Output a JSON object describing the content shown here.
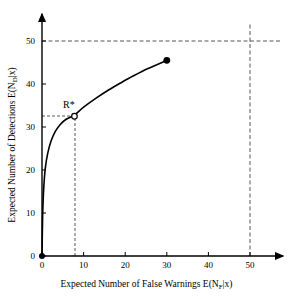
{
  "chart_data": {
    "type": "line",
    "title": "",
    "xlabel_prefix": "Expected Number of False Warnings E(N",
    "xlabel_sub": "F",
    "xlabel_suffix": "|x)",
    "ylabel_prefix": "Expected Number of Detections E(N",
    "ylabel_sub": "D",
    "ylabel_suffix": "|x)",
    "xlabel_full": "Expected Number of False Warnings E(N_F|x)",
    "ylabel_full": "Expected Number of Detections E(N_D|x)",
    "xlim": [
      0,
      58
    ],
    "ylim": [
      0,
      55
    ],
    "xticks": [
      0,
      10,
      20,
      30,
      40,
      50
    ],
    "yticks": [
      0,
      10,
      20,
      30,
      40,
      50
    ],
    "xtick_labels": [
      "0",
      "10",
      "20",
      "30",
      "40",
      "50"
    ],
    "ytick_labels": [
      "0",
      "10",
      "20",
      "30",
      "40",
      "50"
    ],
    "grid": false,
    "legend": "none",
    "axis_arrows": true,
    "series": [
      {
        "name": "Expected detections vs false warnings",
        "x": [
          0,
          0.15,
          0.4,
          0.8,
          1.4,
          2.2,
          3.2,
          4.4,
          5.8,
          7.8,
          10,
          13,
          16,
          19,
          22,
          25.5,
          30
        ],
        "values": [
          0,
          9,
          15.5,
          20.5,
          24,
          26.8,
          29,
          30.6,
          31.8,
          32.8,
          34.6,
          36.7,
          38.6,
          40.3,
          41.9,
          43.6,
          45.5
        ]
      }
    ],
    "markers": [
      {
        "name": "origin-point",
        "x": 0,
        "y": 0,
        "style": "filled-circle",
        "label": ""
      },
      {
        "name": "operating-point-R-star",
        "x": 7.8,
        "y": 32.5,
        "style": "open-circle",
        "label": "R*"
      },
      {
        "name": "curve-endpoint",
        "x": 30,
        "y": 45.5,
        "style": "filled-circle",
        "label": ""
      }
    ],
    "reference_lines": [
      {
        "name": "rstar-horizontal-dashed",
        "orientation": "horizontal",
        "value": 32.5,
        "from": 0,
        "to": 7.8
      },
      {
        "name": "rstar-vertical-dashed",
        "orientation": "vertical",
        "value": 7.8,
        "from": 0,
        "to": 32.5
      },
      {
        "name": "constraint-horizontal-dashed-50",
        "orientation": "horizontal",
        "value": 50,
        "from": 0,
        "to": 55
      },
      {
        "name": "constraint-vertical-dashed-50",
        "orientation": "vertical",
        "value": 50,
        "from": 0,
        "to": 55
      }
    ],
    "annotations": [
      {
        "name": "R-star-annotation",
        "text": "R*",
        "x": 7.8,
        "y": 32.5
      }
    ],
    "colors": {
      "curve": "#000000",
      "axis": "#000000",
      "dashed": "#555555",
      "background": "#ffffff"
    }
  }
}
